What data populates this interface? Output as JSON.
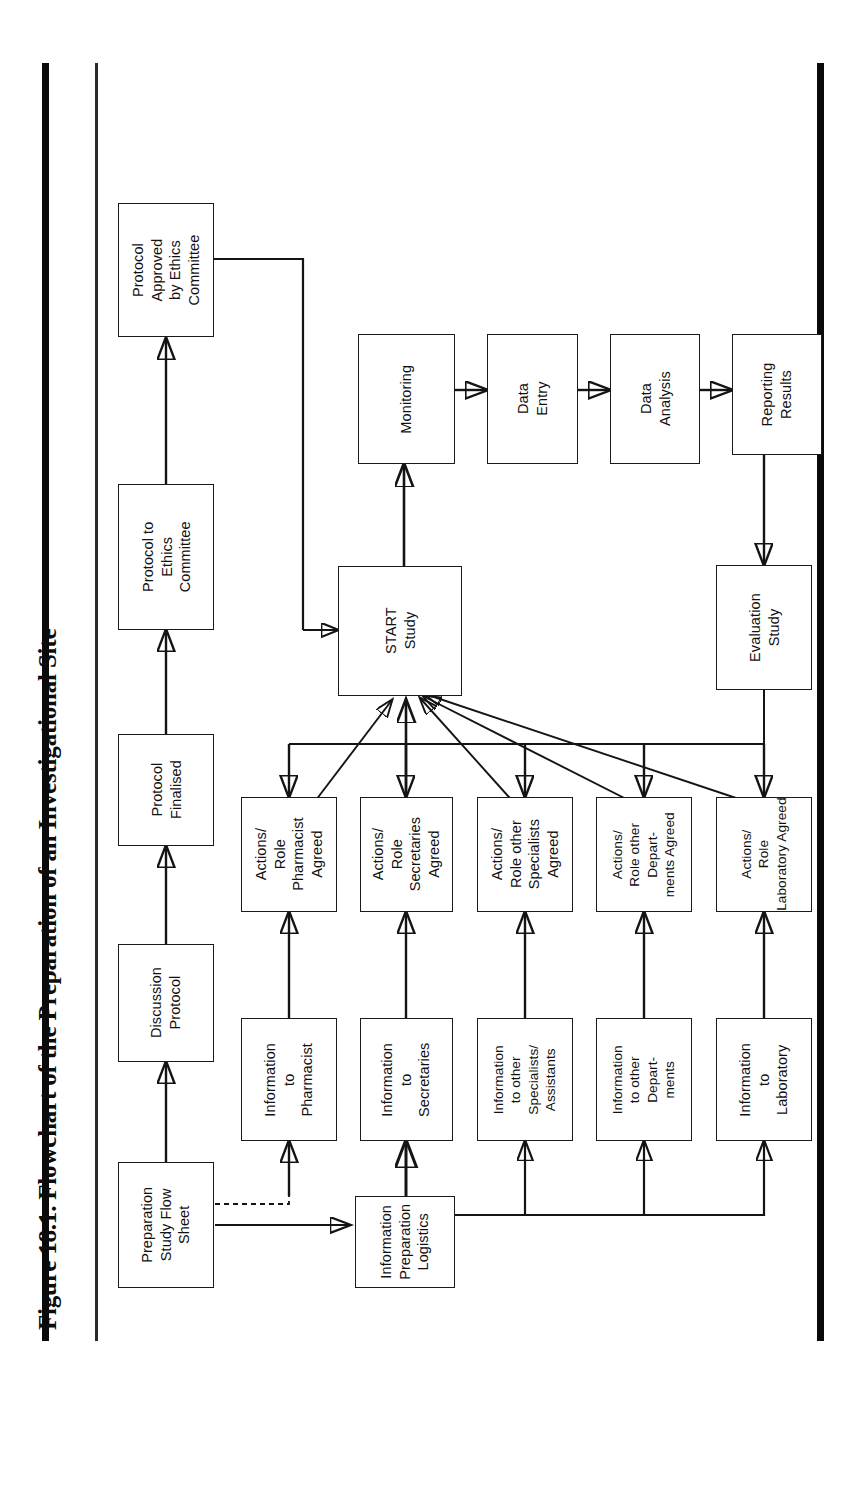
{
  "figure": {
    "caption": "Figure 18.1. Flowchart of the Preparation of an Investigational Site",
    "orientation": "rotated-90-ccw",
    "page_rules": [
      "heavy-left-rule",
      "thin-left-rule",
      "heavy-right-rule"
    ]
  },
  "chart_data": {
    "type": "diagram",
    "title": "Figure 18.1. Flowchart of the Preparation of an Investigational Site",
    "nodes": [
      {
        "id": "prep_sheet",
        "label": "Preparation\nStudy Flow\nSheet"
      },
      {
        "id": "discussion",
        "label": "Discussion\nProtocol"
      },
      {
        "id": "finalised",
        "label": "Protocol\nFinalised"
      },
      {
        "id": "to_ethics",
        "label": "Protocol to\nEthics\nCommittee"
      },
      {
        "id": "approved",
        "label": "Protocol\nApproved\nby Ethics\nCommittee"
      },
      {
        "id": "info_logistics",
        "label": "Information\nPreparation\nLogistics"
      },
      {
        "id": "info_pharmacist",
        "label": "Information\nto\nPharmacist"
      },
      {
        "id": "info_secretaries",
        "label": "Information\nto\nSecretaries"
      },
      {
        "id": "info_specialists",
        "label": "Information\nto other\nSpecialists/\nAssistants"
      },
      {
        "id": "info_departments",
        "label": "Information\nto other\nDepart-\nments"
      },
      {
        "id": "info_laboratory",
        "label": "Information\nto\nLaboratory"
      },
      {
        "id": "act_pharmacist",
        "label": "Actions/\nRole\nPharmacist\nAgreed"
      },
      {
        "id": "act_secretaries",
        "label": "Actions/\nRole\nSecretaries\nAgreed"
      },
      {
        "id": "act_specialists",
        "label": "Actions/\nRole other\nSpecialists\nAgreed"
      },
      {
        "id": "act_departments",
        "label": "Actions/\nRole other\nDepart-\nments Agreed"
      },
      {
        "id": "act_laboratory",
        "label": "Actions/\nRole\nLaboratory Agreed"
      },
      {
        "id": "start_study",
        "label": "START\nStudy"
      },
      {
        "id": "monitoring",
        "label": "Monitoring"
      },
      {
        "id": "data_entry",
        "label": "Data\nEntry"
      },
      {
        "id": "data_analysis",
        "label": "Data\nAnalysis"
      },
      {
        "id": "reporting",
        "label": "Reporting\nResults"
      },
      {
        "id": "evaluation",
        "label": "Evaluation\nStudy"
      }
    ],
    "edges": [
      {
        "from": "prep_sheet",
        "to": "discussion"
      },
      {
        "from": "discussion",
        "to": "finalised"
      },
      {
        "from": "finalised",
        "to": "to_ethics"
      },
      {
        "from": "to_ethics",
        "to": "approved"
      },
      {
        "from": "approved",
        "to": "start_study"
      },
      {
        "from": "prep_sheet",
        "to": "info_logistics"
      },
      {
        "from": "info_logistics",
        "to": "info_pharmacist"
      },
      {
        "from": "info_logistics",
        "to": "info_secretaries"
      },
      {
        "from": "info_logistics",
        "to": "info_specialists"
      },
      {
        "from": "info_logistics",
        "to": "info_departments"
      },
      {
        "from": "info_logistics",
        "to": "info_laboratory"
      },
      {
        "from": "info_pharmacist",
        "to": "act_pharmacist"
      },
      {
        "from": "info_secretaries",
        "to": "act_secretaries"
      },
      {
        "from": "info_specialists",
        "to": "act_specialists"
      },
      {
        "from": "info_departments",
        "to": "act_departments"
      },
      {
        "from": "info_laboratory",
        "to": "act_laboratory"
      },
      {
        "from": "start_study",
        "to": "act_pharmacist"
      },
      {
        "from": "start_study",
        "to": "act_secretaries"
      },
      {
        "from": "start_study",
        "to": "act_specialists"
      },
      {
        "from": "start_study",
        "to": "act_departments"
      },
      {
        "from": "start_study",
        "to": "act_laboratory"
      },
      {
        "from": "act_pharmacist",
        "to": "start_study"
      },
      {
        "from": "act_secretaries",
        "to": "start_study"
      },
      {
        "from": "act_specialists",
        "to": "start_study"
      },
      {
        "from": "act_departments",
        "to": "start_study"
      },
      {
        "from": "act_laboratory",
        "to": "start_study"
      },
      {
        "from": "start_study",
        "to": "monitoring"
      },
      {
        "from": "monitoring",
        "to": "data_entry"
      },
      {
        "from": "data_entry",
        "to": "data_analysis"
      },
      {
        "from": "data_analysis",
        "to": "reporting"
      },
      {
        "from": "reporting",
        "to": "evaluation"
      }
    ]
  },
  "boxes": {
    "approved": "Protocol\nApproved\nby Ethics\nCommittee",
    "to_ethics": "Protocol to\nEthics\nCommittee",
    "finalised": "Protocol\nFinalised",
    "discussion": "Discussion\nProtocol",
    "prep_sheet": "Preparation\nStudy Flow\nSheet",
    "monitoring": "Monitoring",
    "data_entry": "Data\nEntry",
    "data_analysis": "Data\nAnalysis",
    "reporting": "Reporting\nResults",
    "start_study": "START\nStudy",
    "evaluation": "Evaluation\nStudy",
    "act_pharmacist": "Actions/\nRole\nPharmacist\nAgreed",
    "act_secretaries": "Actions/\nRole\nSecretaries\nAgreed",
    "act_specialists": "Actions/\nRole other\nSpecialists\nAgreed",
    "act_departments": "Actions/\nRole other\nDepart-\nments Agreed",
    "act_laboratory": "Actions/\nRole\nLaboratory Agreed",
    "info_pharmacist": "Information\nto\nPharmacist",
    "info_secretaries": "Information\nto\nSecretaries",
    "info_specialists": "Information\nto other\nSpecialists/\nAssistants",
    "info_departments": "Information\nto other\nDepart-\nments",
    "info_laboratory": "Information\nto\nLaboratory",
    "info_logistics": "Information\nPreparation\nLogistics"
  },
  "colors": {
    "ink": "#141414",
    "paper": "#ffffff",
    "rule": "#0a0a0a"
  }
}
